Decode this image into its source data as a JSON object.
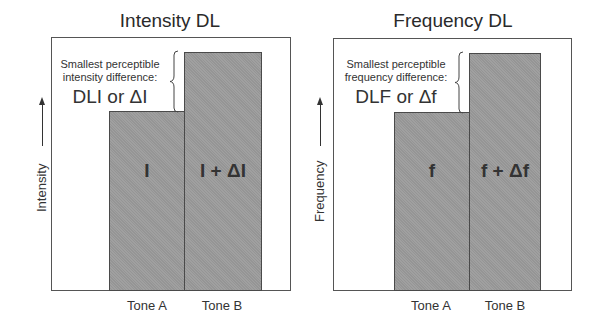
{
  "panels": [
    {
      "title": "Intensity DL",
      "y_axis_label": "Intensity",
      "annotation_line1": "Smallest perceptible",
      "annotation_line2": "intensity difference:",
      "annotation_symbol": "DLI or ΔI",
      "bars": [
        {
          "label": "I",
          "tone": "Tone A"
        },
        {
          "label": "I + ΔI",
          "tone": "Tone B"
        }
      ]
    },
    {
      "title": "Frequency DL",
      "y_axis_label": "Frequency",
      "annotation_line1": "Smallest perceptible",
      "annotation_line2": "frequency difference:",
      "annotation_symbol": "DLF or Δf",
      "bars": [
        {
          "label": "f",
          "tone": "Tone A"
        },
        {
          "label": "f + Δf",
          "tone": "Tone B"
        }
      ]
    }
  ],
  "colors": {
    "bar_fill": "#9b9b9b",
    "frame": "#555555",
    "text": "#333333"
  }
}
